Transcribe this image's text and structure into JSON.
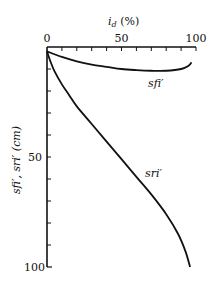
{
  "chart_data": {
    "type": "line",
    "title": "",
    "xlabel": "i_d (%)",
    "ylabel": "s_fi', s_ri' (cm)",
    "xlim": [
      0,
      100
    ],
    "ylim": [
      0,
      100
    ],
    "y_inverted": true,
    "x_axis_position": "top",
    "x_ticks": [
      0,
      50,
      100
    ],
    "y_ticks": [
      50,
      100
    ],
    "grid": false,
    "series": [
      {
        "name": "s_fi'",
        "label": "sfi'",
        "points": [
          [
            0,
            2
          ],
          [
            10,
            4.5
          ],
          [
            20,
            6.5
          ],
          [
            30,
            8
          ],
          [
            40,
            9
          ],
          [
            50,
            10
          ],
          [
            60,
            10.5
          ],
          [
            70,
            10.8
          ],
          [
            80,
            10.8
          ],
          [
            90,
            10
          ],
          [
            95,
            8.5
          ],
          [
            97,
            7
          ]
        ]
      },
      {
        "name": "s_ri'",
        "label": "sri'",
        "points": [
          [
            0,
            2
          ],
          [
            2,
            6
          ],
          [
            5,
            11
          ],
          [
            10,
            17
          ],
          [
            15,
            22
          ],
          [
            20,
            27
          ],
          [
            30,
            35
          ],
          [
            40,
            43
          ],
          [
            50,
            51
          ],
          [
            60,
            59
          ],
          [
            70,
            67
          ],
          [
            80,
            76
          ],
          [
            88,
            85
          ],
          [
            93,
            93
          ],
          [
            96,
            100
          ]
        ]
      }
    ]
  },
  "labels": {
    "x_title": "i",
    "x_title_sub": "d",
    "x_title_unit": " (%)",
    "x_tick_0": "0",
    "x_tick_50": "50",
    "x_tick_100": "100",
    "y_tick_50": "50",
    "y_tick_100": "100",
    "y_title": "sfi′, sri′ (cm)",
    "series_sfi": "sfi′",
    "series_sri": "sri′"
  }
}
